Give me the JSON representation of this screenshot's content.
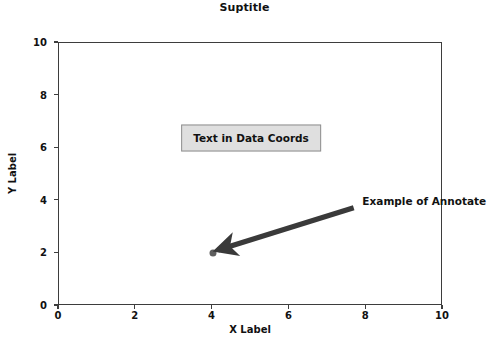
{
  "figure": {
    "suptitle": "Suptitle",
    "background_color": "#ffffff",
    "width_px": 489,
    "height_px": 347
  },
  "chart_data": {
    "type": "scatter",
    "title": "Suptitle",
    "xlabel": "X Label",
    "ylabel": "Y Label",
    "xlim": [
      0,
      10
    ],
    "ylim": [
      0,
      10
    ],
    "xticks": [
      0,
      2,
      4,
      6,
      8,
      10
    ],
    "yticks": [
      0,
      2,
      4,
      6,
      8,
      10
    ],
    "xticklabels": [
      "0",
      "2",
      "4",
      "6",
      "8",
      "10"
    ],
    "yticklabels": [
      "0",
      "2",
      "4",
      "6",
      "8",
      "10"
    ],
    "grid": false,
    "legend": null,
    "series": [
      {
        "name": "point",
        "marker": "circle",
        "color": "#5e5e5e",
        "x": [
          4
        ],
        "y": [
          2
        ]
      }
    ],
    "annotations": [
      {
        "kind": "text-box",
        "text": "Text in Data Coords",
        "x": 5,
        "y": 6.4,
        "facecolor": "#dfdfdf",
        "edgecolor": "#8f8f8f"
      },
      {
        "kind": "annotate-arrow",
        "text": "Example of Annotate",
        "text_x": 7.9,
        "text_y": 4.0,
        "point_x": 4,
        "point_y": 2,
        "tail_x": 7.7,
        "tail_y": 3.7,
        "color": "#3a3a3a"
      }
    ]
  },
  "axes": {
    "spine_color": "#3d3d3d",
    "tick_color": "#3d3d3d"
  }
}
